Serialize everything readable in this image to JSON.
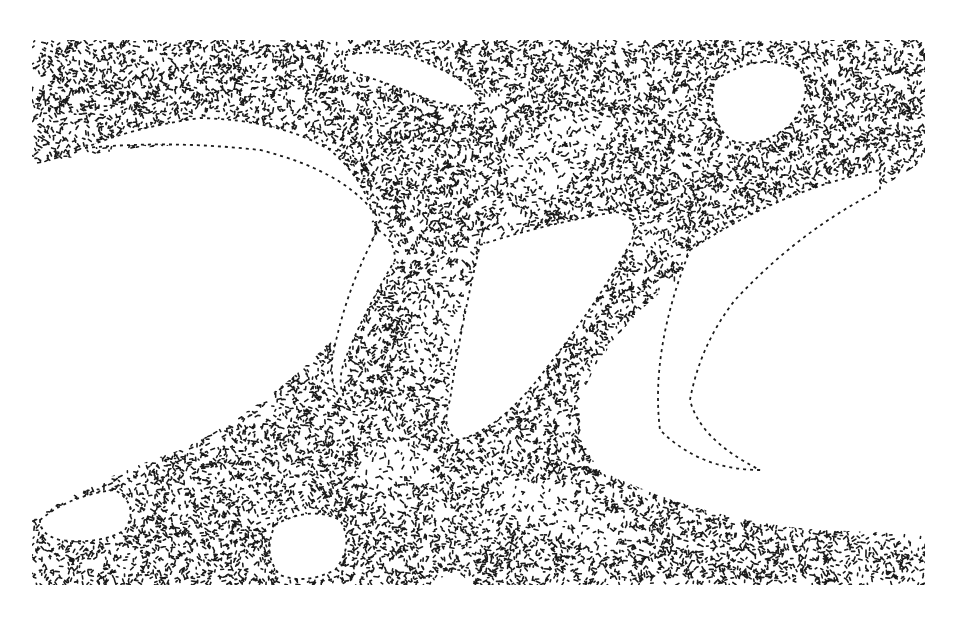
{
  "figure": {
    "type": "stippled ink illustration",
    "background_color": "#ffffff",
    "ink_color": "#1a1a1a",
    "canvas": {
      "width": 961,
      "height": 642
    },
    "frame": {
      "x": 32,
      "y": 40,
      "width": 893,
      "height": 545
    }
  },
  "regions": {
    "tissue": [
      "M32,40 L925,40 L925,160 Q880,190 830,215 Q770,240 700,265 Q640,300 600,360 Q560,420 600,470 Q700,520 820,530 Q880,532 925,535 L925,585 L470,585 Q455,560 435,585 L32,585 L32,520 Q90,480 180,450 Q280,400 340,330 Q380,260 370,200 Q340,150 250,145 Q150,140 32,165 Z"
    ],
    "holes": [
      "M85,148 Q130,128 200,118 Q280,120 330,150 Q360,175 372,210 Q340,170 260,150 Q170,140 85,148 Z",
      "M345,55 Q390,48 420,60 Q470,80 480,100 Q470,112 430,100 Q380,80 345,70 Z",
      "M480,245 Q540,225 615,212 Q640,215 632,240 Q600,300 545,370 Q500,430 458,440 Q440,430 450,400 Q460,330 480,245 Z",
      "M378,230 Q395,240 395,260 Q360,320 345,360 Q335,385 348,405 Q330,395 332,360 Q345,290 378,230 Z",
      "M715,80 Q760,50 800,70 Q815,95 790,125 Q760,150 730,140 Q705,115 715,80 Z",
      "M690,250 Q780,190 880,170 L880,190 Q800,230 735,300 Q700,345 690,400 Q700,440 760,470 Q700,470 660,430 Q650,350 690,250 Z",
      "M40,520 Q70,495 115,490 Q140,505 125,530 Q100,545 60,540 Q40,535 40,520 Z",
      "M275,525 Q310,505 340,520 Q355,545 335,570 Q305,585 280,575 Q262,555 275,525 Z"
    ],
    "light_bands": [
      {
        "cx": 560,
        "cy": 150,
        "rx": 60,
        "ry": 30,
        "rot": -30
      },
      {
        "cx": 470,
        "cy": 300,
        "rx": 40,
        "ry": 90,
        "rot": 35
      },
      {
        "cx": 820,
        "cy": 300,
        "rx": 40,
        "ry": 120,
        "rot": 40
      },
      {
        "cx": 560,
        "cy": 510,
        "rx": 70,
        "ry": 25,
        "rot": 20
      },
      {
        "cx": 400,
        "cy": 470,
        "rx": 40,
        "ry": 25,
        "rot": 0
      }
    ]
  },
  "stipple": {
    "seed": 7,
    "count": 26000,
    "dash_min": 1.2,
    "dash_max": 4.2,
    "stroke_width": 1.6
  }
}
